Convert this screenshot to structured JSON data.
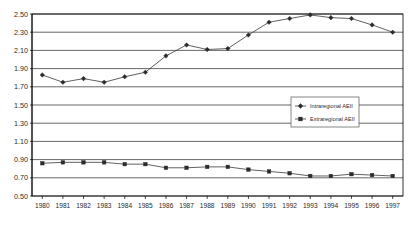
{
  "chart_data": {
    "type": "line",
    "title": "",
    "xlabel": "",
    "ylabel": "",
    "categories": [
      "1980",
      "1981",
      "1982",
      "1983",
      "1984",
      "1985",
      "1986",
      "1987",
      "1988",
      "1989",
      "1990",
      "1991",
      "1992",
      "1993",
      "1994",
      "1995",
      "1996",
      "1997"
    ],
    "series": [
      {
        "name": "Intraregional AEII",
        "marker": "diamond",
        "values": [
          1.83,
          1.75,
          1.79,
          1.75,
          1.81,
          1.86,
          2.04,
          2.16,
          2.11,
          2.12,
          2.27,
          2.41,
          2.45,
          2.49,
          2.46,
          2.45,
          2.38,
          2.3
        ]
      },
      {
        "name": "Extraregional AEII",
        "marker": "square",
        "values": [
          0.86,
          0.87,
          0.87,
          0.87,
          0.85,
          0.85,
          0.81,
          0.81,
          0.82,
          0.82,
          0.79,
          0.77,
          0.75,
          0.72,
          0.72,
          0.74,
          0.73,
          0.72
        ]
      }
    ],
    "ylim": [
      0.5,
      2.5
    ],
    "ytick_step": 0.2,
    "ytick_labels": [
      "2.50",
      "2.30",
      "2.10",
      "1.90",
      "1.70",
      "1.50",
      "1.30",
      "1.10",
      "0.90",
      "0.70",
      "0.50"
    ],
    "grid": true,
    "legend_position": "middle-right"
  },
  "legend": {
    "entries": [
      {
        "label": "Intraregional AEII"
      },
      {
        "label": "Extraregional AEII"
      }
    ]
  },
  "colors": {
    "series_line": "#3a3a3a",
    "marker": "#2b2b2b",
    "gridline": "#000000",
    "frame": "#000000",
    "background": "#ffffff",
    "text": "#2b2b2b"
  }
}
